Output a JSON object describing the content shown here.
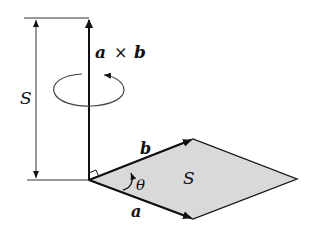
{
  "diagram": {
    "labels": {
      "cross_product": "a × b",
      "cross_a": "a",
      "cross_times": "×",
      "cross_b": "b",
      "height_S": "S",
      "area_S": "S",
      "vector_a": "a",
      "vector_b": "b",
      "angle": "θ"
    },
    "colors": {
      "stroke": "#111111",
      "fill_parallelogram": "#d9d9d9",
      "background": "#ffffff"
    },
    "geometry": {
      "origin": [
        89,
        180
      ],
      "vertex_b": [
        193,
        139
      ],
      "vertex_a": [
        193,
        219
      ],
      "vertex_far": [
        297,
        179
      ],
      "cross_top": [
        89,
        18
      ],
      "measure_x": 36
    }
  }
}
